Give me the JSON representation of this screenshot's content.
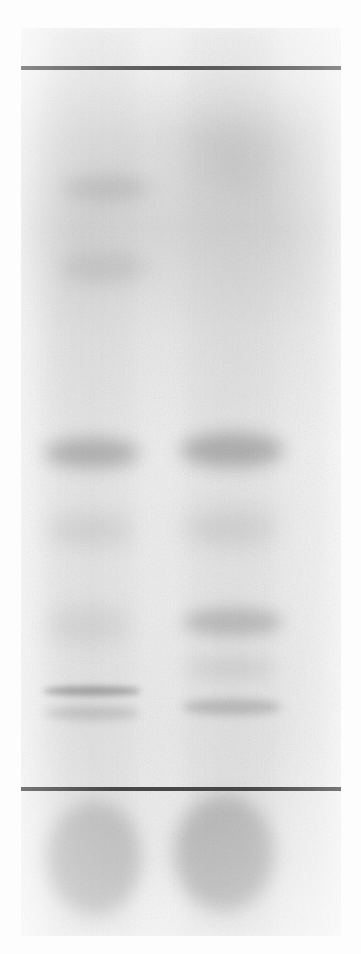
{
  "figure": {
    "kind": "tlc-autoradiograph-plate",
    "title": "Thin-layer chromatography plate",
    "image_width": 361,
    "image_height": 954,
    "background_color": "#fdfdfd"
  },
  "plate": {
    "left": 21,
    "top": 28,
    "width": 320,
    "height": 908,
    "base_color": "#e9e9e9",
    "label": "Chromatography plate"
  },
  "marker_lines": [
    {
      "name": "solvent-front-line",
      "label": "Solvent front line",
      "x": 21,
      "y": 66,
      "width": 320,
      "height": 4,
      "color": "#3b3b3b"
    },
    {
      "name": "origin-line",
      "label": "Origin line",
      "x": 21,
      "y": 787,
      "width": 320,
      "height": 4,
      "color": "#3b3b3b"
    }
  ],
  "lanes": [
    {
      "name": "lane-1",
      "label": "Lane 1",
      "center_x": 92,
      "width": 104,
      "streak_opacity": 0.55
    },
    {
      "name": "lane-2",
      "label": "Lane 2",
      "center_x": 231,
      "width": 110,
      "streak_opacity": 0.62
    }
  ],
  "bands": [
    {
      "lane": 1,
      "name": "lane1-band-1",
      "label": "Lane 1 band 1",
      "cx": 106,
      "cy": 188,
      "rx": 46,
      "ry": 12,
      "opacity": 0.2,
      "blur": 9
    },
    {
      "lane": 1,
      "name": "lane1-band-2",
      "label": "Lane 1 band 2",
      "cx": 104,
      "cy": 268,
      "rx": 44,
      "ry": 14,
      "opacity": 0.17,
      "blur": 10
    },
    {
      "lane": 1,
      "name": "lane1-band-3",
      "label": "Lane 1 band 3 (major)",
      "cx": 92,
      "cy": 453,
      "rx": 48,
      "ry": 15,
      "opacity": 0.44,
      "blur": 9
    },
    {
      "lane": 1,
      "name": "lane1-band-4",
      "label": "Lane 1 band 4",
      "cx": 90,
      "cy": 530,
      "rx": 44,
      "ry": 16,
      "opacity": 0.14,
      "blur": 11
    },
    {
      "lane": 1,
      "name": "lane1-band-5",
      "label": "Lane 1 band 5",
      "cx": 88,
      "cy": 625,
      "rx": 42,
      "ry": 18,
      "opacity": 0.13,
      "blur": 12
    },
    {
      "lane": 1,
      "name": "lane1-band-6",
      "label": "Lane 1 band 6 (sharp)",
      "cx": 92,
      "cy": 691,
      "rx": 49,
      "ry": 5,
      "opacity": 0.55,
      "blur": 3
    },
    {
      "lane": 1,
      "name": "lane1-band-7",
      "label": "Lane 1 band 7",
      "cx": 92,
      "cy": 713,
      "rx": 48,
      "ry": 7,
      "opacity": 0.26,
      "blur": 5
    },
    {
      "lane": 2,
      "name": "lane2-band-1",
      "label": "Lane 2 band 1 (diffuse)",
      "cx": 240,
      "cy": 150,
      "rx": 52,
      "ry": 40,
      "opacity": 0.13,
      "blur": 22
    },
    {
      "lane": 2,
      "name": "lane2-band-2",
      "label": "Lane 2 band 2 (major)",
      "cx": 232,
      "cy": 450,
      "rx": 52,
      "ry": 17,
      "opacity": 0.46,
      "blur": 9
    },
    {
      "lane": 2,
      "name": "lane2-band-3",
      "label": "Lane 2 band 3",
      "cx": 230,
      "cy": 528,
      "rx": 48,
      "ry": 17,
      "opacity": 0.16,
      "blur": 12
    },
    {
      "lane": 2,
      "name": "lane2-band-4",
      "label": "Lane 2 band 4",
      "cx": 233,
      "cy": 622,
      "rx": 50,
      "ry": 14,
      "opacity": 0.34,
      "blur": 8
    },
    {
      "lane": 2,
      "name": "lane2-band-5",
      "label": "Lane 2 band 5",
      "cx": 231,
      "cy": 668,
      "rx": 46,
      "ry": 10,
      "opacity": 0.15,
      "blur": 9
    },
    {
      "lane": 2,
      "name": "lane2-band-6",
      "label": "Lane 2 band 6",
      "cx": 232,
      "cy": 707,
      "rx": 50,
      "ry": 8,
      "opacity": 0.34,
      "blur": 5
    }
  ],
  "origin_spots": [
    {
      "name": "origin-spot-lane-1",
      "label": "Lane 1 origin spot",
      "cx": 94,
      "cy": 858,
      "rx": 47,
      "ry": 57,
      "opacity": 0.4,
      "blur": 9
    },
    {
      "name": "origin-spot-lane-2",
      "label": "Lane 2 origin spot",
      "cx": 224,
      "cy": 853,
      "rx": 50,
      "ry": 58,
      "opacity": 0.44,
      "blur": 9
    }
  ],
  "colors": {
    "band_color": "#6f6f6f",
    "spot_color": "#8a8a8a",
    "line_color": "#3b3b3b",
    "plate_color": "#e9e9e9",
    "page_background": "#fdfdfd"
  }
}
